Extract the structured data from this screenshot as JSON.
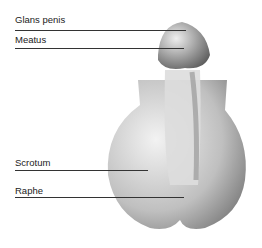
{
  "diagram": {
    "labels": [
      {
        "text": "Glans penis"
      },
      {
        "text": "Meatus"
      },
      {
        "text": "Scrotum"
      },
      {
        "text": "Raphe"
      }
    ]
  }
}
